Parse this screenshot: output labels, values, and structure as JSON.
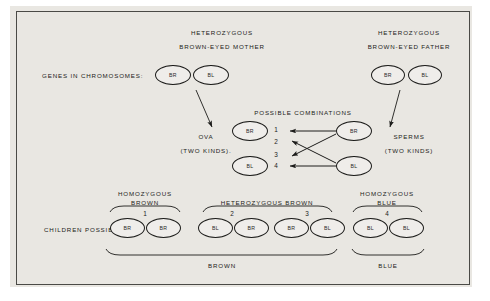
{
  "diagram": {
    "title_semantic": "mendelian-eye-color-inheritance",
    "row_labels": {
      "genes": "GENES IN CHROMOSOMES:",
      "children": "CHILDREN POSSIBLE:"
    },
    "parents": {
      "mother": {
        "line1": "HETEROZYGOUS",
        "line2": "BROWN-EYED MOTHER",
        "alleles": [
          "BR",
          "BL"
        ]
      },
      "father": {
        "line1": "HETEROZYGOUS",
        "line2": "BROWN-EYED FATHER",
        "alleles": [
          "BR",
          "BL"
        ]
      }
    },
    "gametes": {
      "ova": {
        "line1": "OVA",
        "line2": "(TWO KINDS).",
        "alleles": [
          "BR",
          "BL"
        ]
      },
      "sperms": {
        "line1": "SPERMS",
        "line2": "(TWO KINDS)",
        "alleles": [
          "BR",
          "BL"
        ]
      }
    },
    "combinations": {
      "heading": "POSSIBLE COMBINATIONS",
      "numbers": [
        "1",
        "2",
        "3",
        "4"
      ]
    },
    "children": {
      "groups": [
        {
          "number": "1",
          "zygosity_line1": "HOMOZYGOUS",
          "zygosity_line2": "BROWN",
          "alleles": [
            "BR",
            "BR"
          ]
        },
        {
          "number": "2",
          "zygosity_line1": "HETEROZYGOUS",
          "zygosity_line2": "BROWN",
          "alleles": [
            "BL",
            "BR"
          ]
        },
        {
          "number": "3",
          "zygosity_line1": "",
          "zygosity_line2": "",
          "alleles": [
            "BR",
            "BL"
          ]
        },
        {
          "number": "4",
          "zygosity_line1": "HOMOZYGOUS",
          "zygosity_line2": "BLUE",
          "alleles": [
            "BL",
            "BL"
          ]
        }
      ],
      "heterozygous_brown_label": "HETEROZYGOUS BROWN",
      "phenotype_brown": "BROWN",
      "phenotype_blue": "BLUE"
    },
    "colors": {
      "ink": "#1c1c1a",
      "paper": "#e9e7e2",
      "border": "#4a4a46"
    }
  }
}
